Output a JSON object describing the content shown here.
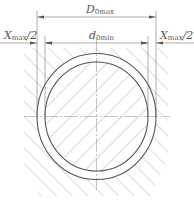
{
  "diagram": {
    "type": "engineering-tolerance-drawing",
    "labels": {
      "top_dimension": {
        "main": "D",
        "sub": "0max"
      },
      "inner_dimension": {
        "main": "d",
        "sub": "0min"
      },
      "left_clearance": {
        "main": "X",
        "sub": "max",
        "suffix": "/2"
      },
      "right_clearance": {
        "main": "X",
        "sub": "max",
        "suffix": "/2"
      }
    },
    "colors": {
      "line": "#555555",
      "hatch": "#9a9a9a",
      "centerline": "#9a9a9a",
      "background": "#ffffff"
    },
    "geometry": {
      "center": [
        96.5,
        116.5
      ],
      "outer_circle": {
        "rx": 59.5,
        "ry": 63
      },
      "inner_circle": {
        "rx": 51.5,
        "ry": 54.5
      },
      "outer_extension_x": [
        37,
        156
      ],
      "inner_extension_x": [
        45,
        148
      ],
      "dim_line_y": [
        17,
        43
      ]
    }
  }
}
